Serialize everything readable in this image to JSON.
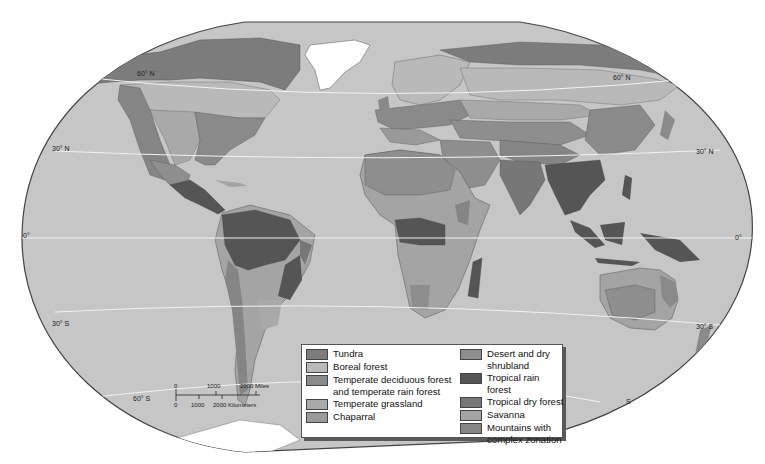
{
  "map": {
    "title": "World biomes",
    "ocean_color": "#c6c6c6",
    "outline_color": "#444444",
    "latitude_labels": {
      "n60_left": "60° N",
      "n60_right": "60° N",
      "n30_left": "30° N",
      "n30_right": "30° N",
      "eq_left": "0°",
      "eq_right": "0°",
      "s30_left": "30° S",
      "s30_right": "30° S",
      "s60_left": "60° S",
      "s60_right": "S"
    },
    "scale_bar": {
      "miles_ticks": [
        "0",
        "1000",
        "2000 Miles"
      ],
      "km_ticks": [
        "0",
        "1000",
        "2000 Kilometers"
      ]
    }
  },
  "legend": {
    "left": [
      {
        "label": "Tundra",
        "color": "#7c7c7c"
      },
      {
        "label": "Boreal forest",
        "color": "#b9b9b9"
      },
      {
        "label": "Temperate deciduous forest\nand temperate rain forest",
        "color": "#8a8a8a"
      },
      {
        "label": "Temperate grassland",
        "color": "#a9a9a9"
      },
      {
        "label": "Chaparral",
        "color": "#9a9a9a"
      }
    ],
    "right": [
      {
        "label": "Desert and dry shrubland",
        "color": "#8e8e8e"
      },
      {
        "label": "Tropical rain forest",
        "color": "#555555"
      },
      {
        "label": "Tropical dry forest",
        "color": "#777777"
      },
      {
        "label": "Savanna",
        "color": "#a4a4a4"
      },
      {
        "label": "Mountains with\ncomplex zonation",
        "color": "#858585"
      }
    ]
  }
}
